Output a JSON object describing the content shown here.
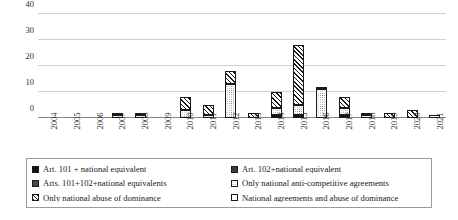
{
  "chart_data": {
    "type": "bar",
    "title": "",
    "xlabel": "",
    "ylabel": "",
    "ylim": [
      0,
      40
    ],
    "yticks": [
      0,
      10,
      20,
      30,
      40
    ],
    "grid": true,
    "stacked": true,
    "legend_position": "bottom",
    "categories": [
      "2004",
      "2005",
      "2006",
      "2007",
      "2008",
      "2009",
      "2010",
      "2011",
      "2012",
      "2013",
      "2014",
      "2015",
      "2016",
      "2017",
      "2018",
      "2019",
      "2020",
      "2021"
    ],
    "series": [
      {
        "name": "Art. 101 + national equivalent",
        "pattern": "solid-black",
        "values": [
          0,
          0,
          0,
          0,
          0,
          0,
          0,
          0,
          0,
          0,
          1,
          1,
          0,
          1,
          0,
          0,
          0,
          0
        ]
      },
      {
        "name": "Art. 102+national equivalent",
        "pattern": "dark-gray",
        "values": [
          0,
          0,
          0,
          0,
          0,
          0,
          0,
          0,
          0,
          0,
          0,
          0,
          0,
          0,
          0,
          0,
          0,
          0
        ]
      },
      {
        "name": "Arts. 101+102+national equivalents",
        "pattern": "mid-gray",
        "values": [
          0,
          0,
          0,
          0,
          0,
          0,
          0,
          0,
          0,
          0,
          0,
          0,
          0,
          0,
          0,
          0,
          0,
          0
        ]
      },
      {
        "name": "Only national anti-competitive agreements",
        "pattern": "dots",
        "values": [
          0,
          0,
          0,
          1,
          1,
          0,
          3,
          1,
          13,
          0,
          3,
          4,
          11,
          3,
          1,
          0,
          0,
          0
        ]
      },
      {
        "name": "Only national abuse of dominance",
        "pattern": "diag",
        "values": [
          0,
          0,
          0,
          1,
          1,
          0,
          5,
          4,
          5,
          2,
          6,
          23,
          1,
          4,
          0,
          2,
          3,
          0
        ]
      },
      {
        "name": "National agreements  and abuse of dominance",
        "pattern": "white",
        "values": [
          0,
          0,
          0,
          0,
          0,
          0,
          0,
          0,
          0,
          0,
          0,
          0,
          0,
          0,
          1,
          0,
          0,
          1
        ]
      }
    ],
    "totals": [
      0,
      0,
      0,
      2,
      2,
      0,
      8,
      5,
      18,
      2,
      10,
      28,
      12,
      8,
      2,
      2,
      3,
      1
    ]
  },
  "legend": {
    "items": [
      {
        "label": "Art. 101 + national equivalent",
        "pattern": "solid-black"
      },
      {
        "label": "Art. 102+national equivalent",
        "pattern": "dark-gray"
      },
      {
        "label": "Arts. 101+102+national equivalents",
        "pattern": "mid-gray"
      },
      {
        "label": "Only national anti-competitive agreements",
        "pattern": "dots"
      },
      {
        "label": "Only national abuse of dominance",
        "pattern": "diag"
      },
      {
        "label": "National agreements  and abuse of dominance",
        "pattern": "white"
      }
    ]
  },
  "colors": {
    "gridline": "#d0d0d0",
    "axis": "#8a8a8a",
    "text": "#1a1a1a",
    "legend_border": "#9a9a9a",
    "background": "#ffffff"
  }
}
